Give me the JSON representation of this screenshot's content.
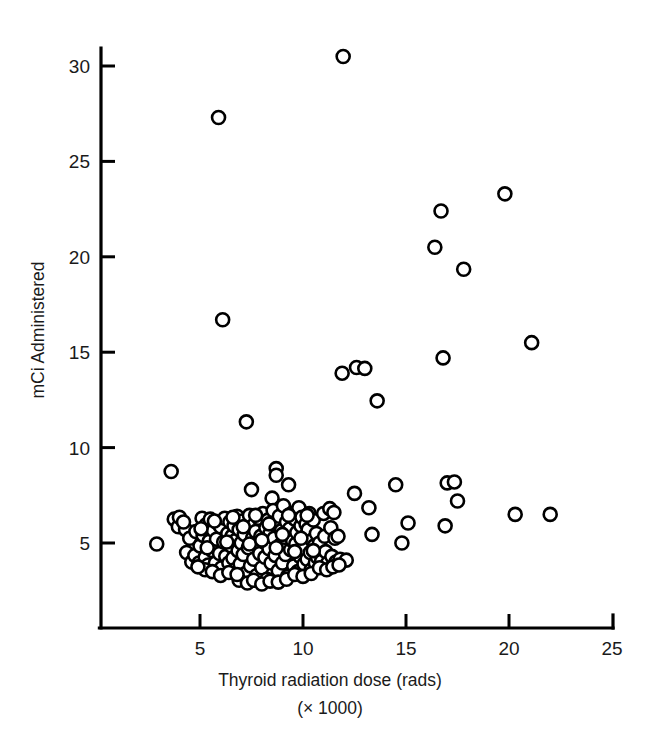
{
  "figure": {
    "background_color": "#ffffff",
    "ink_color": "#000000",
    "marker_fill": "#ffffff"
  },
  "chart_data": {
    "type": "scatter",
    "title": "",
    "subtitle": "",
    "xlabel": "Thyroid radiation dose (rads)",
    "xlabel_line2": "(× 1000)",
    "ylabel": "mCi Administered",
    "xlim": [
      2.2,
      25.0
    ],
    "ylim": [
      2.0,
      31.5
    ],
    "xticks": [
      5,
      10,
      15,
      20,
      25
    ],
    "xticklabels": [
      "5",
      "10",
      "15",
      "20",
      "25"
    ],
    "yticks": [
      5,
      10,
      15,
      20,
      25,
      30
    ],
    "yticklabels": [
      "5",
      "10",
      "15",
      "20",
      "25",
      "30"
    ],
    "grid": false,
    "legend": null,
    "marker": "open-circle",
    "marker_size_px": 13,
    "n_points": 198,
    "annotations": [],
    "series": [
      {
        "name": "patients",
        "points": [
          [
            2.9,
            4.95
          ],
          [
            3.6,
            8.75
          ],
          [
            3.75,
            6.25
          ],
          [
            3.95,
            5.85
          ],
          [
            4.0,
            6.35
          ],
          [
            4.3,
            5.7
          ],
          [
            4.35,
            4.5
          ],
          [
            4.5,
            5.25
          ],
          [
            4.6,
            4.0
          ],
          [
            4.75,
            4.35
          ],
          [
            4.8,
            5.6
          ],
          [
            4.95,
            3.95
          ],
          [
            5.0,
            4.85
          ],
          [
            5.1,
            6.3
          ],
          [
            5.15,
            5.4
          ],
          [
            5.25,
            4.25
          ],
          [
            5.3,
            5.95
          ],
          [
            5.4,
            3.85
          ],
          [
            5.45,
            5.1
          ],
          [
            5.5,
            6.25
          ],
          [
            5.6,
            4.6
          ],
          [
            5.65,
            5.65
          ],
          [
            5.75,
            3.95
          ],
          [
            5.8,
            5.2
          ],
          [
            5.85,
            6.05
          ],
          [
            5.9,
            27.3
          ],
          [
            5.95,
            4.45
          ],
          [
            6.0,
            5.85
          ],
          [
            6.05,
            3.7
          ],
          [
            6.1,
            16.7
          ],
          [
            6.15,
            5.05
          ],
          [
            6.2,
            6.3
          ],
          [
            6.25,
            4.3
          ],
          [
            6.35,
            5.5
          ],
          [
            6.4,
            3.95
          ],
          [
            6.45,
            6.1
          ],
          [
            6.5,
            4.85
          ],
          [
            6.55,
            5.35
          ],
          [
            6.6,
            4.2
          ],
          [
            6.65,
            5.9
          ],
          [
            6.7,
            3.6
          ],
          [
            6.75,
            5.15
          ],
          [
            6.8,
            6.4
          ],
          [
            6.85,
            4.6
          ],
          [
            6.9,
            5.7
          ],
          [
            6.95,
            3.9
          ],
          [
            7.0,
            5.0
          ],
          [
            7.05,
            6.15
          ],
          [
            7.1,
            4.4
          ],
          [
            7.15,
            5.45
          ],
          [
            7.2,
            3.4
          ],
          [
            7.25,
            11.35
          ],
          [
            7.3,
            5.95
          ],
          [
            7.35,
            4.75
          ],
          [
            7.4,
            6.45
          ],
          [
            7.45,
            3.8
          ],
          [
            7.5,
            7.8
          ],
          [
            7.55,
            5.25
          ],
          [
            7.6,
            4.15
          ],
          [
            7.65,
            6.0
          ],
          [
            7.7,
            5.6
          ],
          [
            7.75,
            3.3
          ],
          [
            7.8,
            4.9
          ],
          [
            7.85,
            6.3
          ],
          [
            7.9,
            4.45
          ],
          [
            7.95,
            5.35
          ],
          [
            8.0,
            3.7
          ],
          [
            8.05,
            6.55
          ],
          [
            8.1,
            5.05
          ],
          [
            8.15,
            4.25
          ],
          [
            8.2,
            5.8
          ],
          [
            8.25,
            3.1
          ],
          [
            8.3,
            6.2
          ],
          [
            8.35,
            4.7
          ],
          [
            8.4,
            5.5
          ],
          [
            8.45,
            3.95
          ],
          [
            8.5,
            7.35
          ],
          [
            8.55,
            6.7
          ],
          [
            8.6,
            5.25
          ],
          [
            8.65,
            4.35
          ],
          [
            8.7,
            8.9
          ],
          [
            8.7,
            8.55
          ],
          [
            8.75,
            5.95
          ],
          [
            8.8,
            3.55
          ],
          [
            8.85,
            6.4
          ],
          [
            8.9,
            4.9
          ],
          [
            8.95,
            5.65
          ],
          [
            9.0,
            3.95
          ],
          [
            9.05,
            6.95
          ],
          [
            9.1,
            5.3
          ],
          [
            9.15,
            4.4
          ],
          [
            9.2,
            6.1
          ],
          [
            9.25,
            3.25
          ],
          [
            9.3,
            8.05
          ],
          [
            9.35,
            5.75
          ],
          [
            9.4,
            4.65
          ],
          [
            9.45,
            6.55
          ],
          [
            9.5,
            5.1
          ],
          [
            9.55,
            3.8
          ],
          [
            9.6,
            6.25
          ],
          [
            9.65,
            4.95
          ],
          [
            9.7,
            5.55
          ],
          [
            9.75,
            3.5
          ],
          [
            9.8,
            6.85
          ],
          [
            9.85,
            4.3
          ],
          [
            9.9,
            5.9
          ],
          [
            9.95,
            6.35
          ],
          [
            10.0,
            4.7
          ],
          [
            10.05,
            3.9
          ],
          [
            10.1,
            5.35
          ],
          [
            10.15,
            6.0
          ],
          [
            10.2,
            4.15
          ],
          [
            10.25,
            5.7
          ],
          [
            10.3,
            6.55
          ],
          [
            10.35,
            4.5
          ],
          [
            10.4,
            3.6
          ],
          [
            10.45,
            5.15
          ],
          [
            10.5,
            6.2
          ],
          [
            10.55,
            4.85
          ],
          [
            10.6,
            3.95
          ],
          [
            10.65,
            5.5
          ],
          [
            10.7,
            4.25
          ],
          [
            10.8,
            5.0
          ],
          [
            10.9,
            4.05
          ],
          [
            11.0,
            6.55
          ],
          [
            11.05,
            5.35
          ],
          [
            11.1,
            4.55
          ],
          [
            11.2,
            3.95
          ],
          [
            11.3,
            6.8
          ],
          [
            11.35,
            5.8
          ],
          [
            11.4,
            4.3
          ],
          [
            11.5,
            6.6
          ],
          [
            11.55,
            5.25
          ],
          [
            11.6,
            4.0
          ],
          [
            11.7,
            5.35
          ],
          [
            11.8,
            4.15
          ],
          [
            11.9,
            13.9
          ],
          [
            11.95,
            30.5
          ],
          [
            12.1,
            4.1
          ],
          [
            12.5,
            7.6
          ],
          [
            12.6,
            14.2
          ],
          [
            13.0,
            14.15
          ],
          [
            13.2,
            6.85
          ],
          [
            13.35,
            5.45
          ],
          [
            13.6,
            12.45
          ],
          [
            14.5,
            8.05
          ],
          [
            14.8,
            5.0
          ],
          [
            15.1,
            6.05
          ],
          [
            16.4,
            20.5
          ],
          [
            16.7,
            22.4
          ],
          [
            16.8,
            14.7
          ],
          [
            16.9,
            5.9
          ],
          [
            17.0,
            8.15
          ],
          [
            17.35,
            8.2
          ],
          [
            17.5,
            7.2
          ],
          [
            17.8,
            19.35
          ],
          [
            19.8,
            23.3
          ],
          [
            20.3,
            6.5
          ],
          [
            21.1,
            15.5
          ],
          [
            22.0,
            6.5
          ],
          [
            4.2,
            6.1
          ],
          [
            5.05,
            5.75
          ],
          [
            5.35,
            4.75
          ],
          [
            5.7,
            6.15
          ],
          [
            6.3,
            5.05
          ],
          [
            6.6,
            6.35
          ],
          [
            7.1,
            5.85
          ],
          [
            7.4,
            4.95
          ],
          [
            7.7,
            6.45
          ],
          [
            8.0,
            5.15
          ],
          [
            8.35,
            6.0
          ],
          [
            8.7,
            4.75
          ],
          [
            9.0,
            5.45
          ],
          [
            9.3,
            6.45
          ],
          [
            9.6,
            4.55
          ],
          [
            9.9,
            5.25
          ],
          [
            10.2,
            6.45
          ],
          [
            10.5,
            4.6
          ],
          [
            6.9,
            3.05
          ],
          [
            7.3,
            2.9
          ],
          [
            7.6,
            3.05
          ],
          [
            8.0,
            2.85
          ],
          [
            8.4,
            3.0
          ],
          [
            8.8,
            2.95
          ],
          [
            9.2,
            3.1
          ],
          [
            9.6,
            3.35
          ],
          [
            10.0,
            3.25
          ],
          [
            10.4,
            3.4
          ],
          [
            5.25,
            3.6
          ],
          [
            5.6,
            3.5
          ],
          [
            6.0,
            3.3
          ],
          [
            6.4,
            3.45
          ],
          [
            6.8,
            3.35
          ],
          [
            10.8,
            3.7
          ],
          [
            11.15,
            3.6
          ],
          [
            11.45,
            3.75
          ],
          [
            11.75,
            3.85
          ],
          [
            4.9,
            3.75
          ]
        ]
      }
    ]
  }
}
